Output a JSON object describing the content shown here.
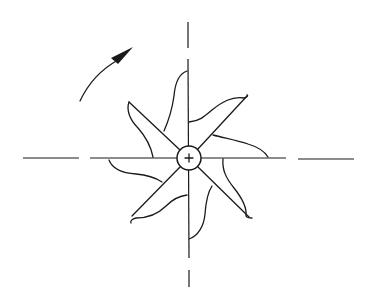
{
  "figure": {
    "type": "technical-diagram",
    "blade_count": 8,
    "rotation_direction": "counter-clockwise",
    "hub": {
      "center_mark": "+",
      "shape": "circle"
    },
    "center_lines": [
      "horizontal-dashed",
      "vertical-dashed"
    ],
    "colors": {
      "ink": "#1a1a1a",
      "background": "#ffffff"
    }
  }
}
